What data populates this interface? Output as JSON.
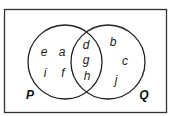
{
  "diagram": {
    "type": "venn",
    "sets": [
      {
        "name": "P",
        "label_pos": [
          30,
          95
        ]
      },
      {
        "name": "Q",
        "label_pos": [
          144,
          95
        ]
      }
    ],
    "regions": {
      "P_only": [
        "e",
        "a",
        "i",
        "f"
      ],
      "P_and_Q": [
        "d",
        "g",
        "h"
      ],
      "Q_only": [
        "b",
        "c",
        "j"
      ]
    },
    "elements": [
      {
        "id": "e",
        "text": "e",
        "x": 44,
        "y": 52
      },
      {
        "id": "a",
        "text": "a",
        "x": 62,
        "y": 52
      },
      {
        "id": "i",
        "text": "i",
        "x": 45,
        "y": 73
      },
      {
        "id": "f",
        "text": "f",
        "x": 63,
        "y": 73
      },
      {
        "id": "d",
        "text": "d",
        "x": 86,
        "y": 45
      },
      {
        "id": "g",
        "text": "g",
        "x": 86,
        "y": 60
      },
      {
        "id": "h",
        "text": "h",
        "x": 87,
        "y": 76
      },
      {
        "id": "b",
        "text": "b",
        "x": 113,
        "y": 42
      },
      {
        "id": "c",
        "text": "c",
        "x": 125,
        "y": 61
      },
      {
        "id": "j",
        "text": "j",
        "x": 116,
        "y": 80
      }
    ],
    "set_labels": {
      "P": "P",
      "Q": "Q"
    }
  }
}
